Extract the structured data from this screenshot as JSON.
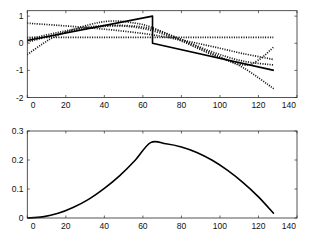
{
  "figure": {
    "panel_count": 2
  },
  "chart_data": [
    {
      "type": "line",
      "title": "",
      "xlabel": "",
      "ylabel": "",
      "xlim": [
        0,
        140
      ],
      "ylim": [
        -2,
        1.2
      ],
      "grid": false,
      "legend": null,
      "xticks": [
        0,
        20,
        40,
        60,
        80,
        100,
        120,
        140
      ],
      "xtick_labels": [
        "0",
        "20",
        "40",
        "60",
        "80",
        "100",
        "120",
        "140"
      ],
      "yticks": [
        1,
        0,
        -1,
        -2
      ],
      "ytick_labels": [
        "1",
        "0",
        "-1",
        "-2"
      ],
      "series": [
        {
          "style": "dotted",
          "smooth": true,
          "x": [
            0,
            128
          ],
          "y": [
            0.22,
            0.22
          ]
        },
        {
          "style": "dotted",
          "smooth": true,
          "x": [
            0,
            16,
            32,
            48,
            64,
            80,
            96,
            112,
            128
          ],
          "y": [
            0.74,
            0.66,
            0.57,
            0.46,
            0.32,
            0.12,
            -0.12,
            -0.38,
            -0.6
          ]
        },
        {
          "style": "dotted",
          "smooth": true,
          "x": [
            0,
            16,
            32,
            48,
            64,
            80,
            96,
            112,
            128
          ],
          "y": [
            0.14,
            0.4,
            0.6,
            0.66,
            0.54,
            0.14,
            -0.32,
            -0.66,
            -0.8
          ]
        },
        {
          "style": "dotted",
          "smooth": true,
          "x": [
            0,
            16,
            32,
            48,
            64,
            80,
            96,
            112,
            120,
            128
          ],
          "y": [
            0.04,
            0.34,
            0.56,
            0.64,
            0.48,
            0.08,
            -0.42,
            -0.8,
            -0.62,
            -0.13
          ]
        },
        {
          "style": "dotted",
          "smooth": true,
          "x": [
            0,
            8,
            16,
            32,
            44,
            56,
            64,
            80,
            96,
            112,
            128
          ],
          "y": [
            -0.42,
            -0.02,
            0.3,
            0.68,
            0.82,
            0.74,
            0.6,
            0.12,
            -0.38,
            -0.9,
            -1.68
          ]
        },
        {
          "style": "solid",
          "smooth": false,
          "x": [
            0,
            65,
            65,
            128
          ],
          "y": [
            0.1,
            1.0,
            0.0,
            -1.0
          ]
        }
      ]
    },
    {
      "type": "line",
      "title": "",
      "xlabel": "",
      "ylabel": "",
      "xlim": [
        0,
        140
      ],
      "ylim": [
        0,
        0.3
      ],
      "grid": false,
      "legend": null,
      "xticks": [
        0,
        20,
        40,
        60,
        80,
        100,
        120,
        140
      ],
      "xtick_labels": [
        "0",
        "20",
        "40",
        "60",
        "80",
        "100",
        "120",
        "140"
      ],
      "yticks": [
        0.3,
        0.2,
        0.1,
        0
      ],
      "ytick_labels": [
        "0.3",
        "0.2",
        "0.1",
        "0"
      ],
      "series": [
        {
          "style": "solid",
          "smooth": true,
          "x": [
            0,
            8,
            16,
            24,
            32,
            40,
            48,
            56,
            64,
            72,
            80,
            88,
            96,
            104,
            112,
            120,
            128
          ],
          "y": [
            0,
            0.004,
            0.016,
            0.037,
            0.065,
            0.102,
            0.146,
            0.199,
            0.26,
            0.256,
            0.245,
            0.226,
            0.199,
            0.164,
            0.122,
            0.073,
            0.015
          ]
        }
      ]
    }
  ]
}
